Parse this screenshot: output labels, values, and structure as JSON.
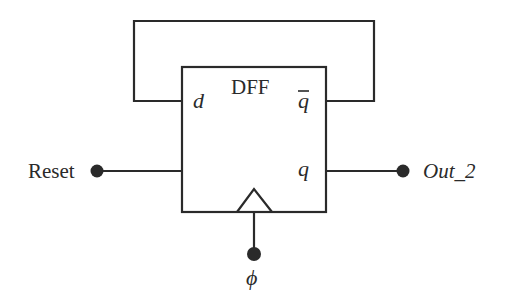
{
  "diagram": {
    "type": "D flip-flop circuit",
    "block": {
      "title": "DFF",
      "ports": {
        "d": "d",
        "qbar": "q",
        "q": "q",
        "clock": "clock-triangle"
      }
    },
    "external": {
      "reset_label": "Reset",
      "output_label": "Out_2",
      "clock_label": "ϕ"
    },
    "connections": [
      {
        "from": "qbar",
        "to": "d",
        "kind": "feedback-loop"
      },
      {
        "from": "Reset",
        "to": "block-left-input"
      },
      {
        "from": "q",
        "to": "Out_2"
      },
      {
        "from": "ϕ",
        "to": "clock"
      }
    ],
    "colors": {
      "ink": "#2a2a2a",
      "background": "#ffffff"
    }
  }
}
